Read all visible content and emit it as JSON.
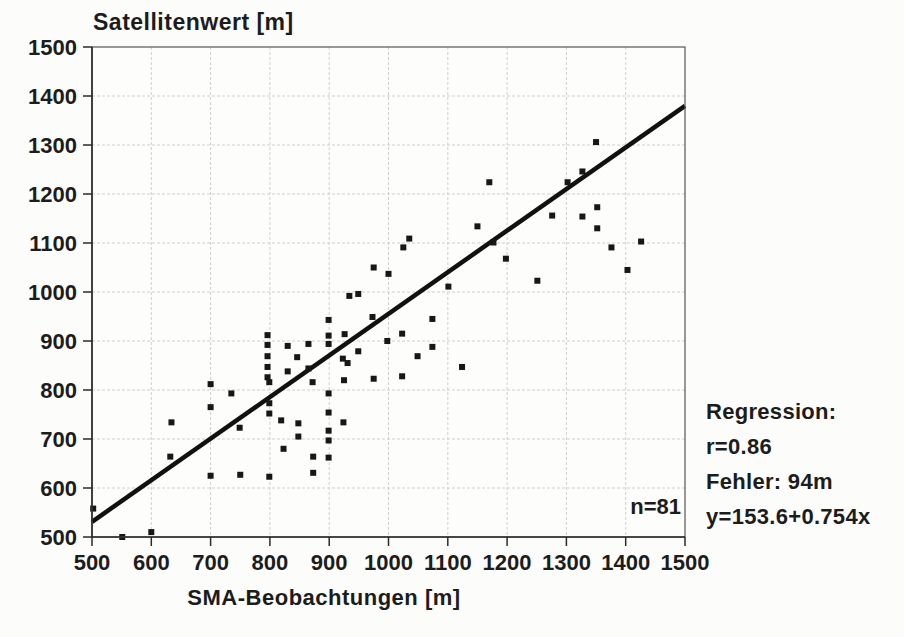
{
  "figure": {
    "title": "Satellitenwert [m]",
    "x_axis_title": "SMA-Beobachtungen [m]",
    "n_label": "n=81",
    "annotation": {
      "heading": "Regression:",
      "r_line": "r=0.86",
      "error_line": "Fehler: 94m",
      "equation_line": "y=153.6+0.754x"
    }
  },
  "colors": {
    "background": "#fcfcfa",
    "ink": "#1c1c1c",
    "grid": "#cdd1cc",
    "axis": "#2b2b2b",
    "box": "#555555",
    "point": "#171717",
    "regression_line": "#111111"
  },
  "chart_data": {
    "type": "scatter",
    "title": "Satellitenwert [m]",
    "xlabel": "SMA-Beobachtungen [m]",
    "ylabel": "Satellitenwert [m]",
    "xlim": [
      500,
      1500
    ],
    "ylim": [
      500,
      1500
    ],
    "x_ticks": [
      500,
      600,
      700,
      800,
      900,
      1000,
      1100,
      1200,
      1300,
      1400,
      1500
    ],
    "y_ticks": [
      500,
      600,
      700,
      800,
      900,
      1000,
      1100,
      1200,
      1300,
      1400,
      1500
    ],
    "grid": true,
    "n": 81,
    "annotations": [
      "n=81",
      "Regression:",
      "r=0.86",
      "Fehler: 94m",
      "y=153.6+0.754x"
    ],
    "regression": {
      "r": 0.86,
      "fehler_m": 94,
      "equation": "y=153.6+0.754x",
      "intercept": 153.6,
      "slope": 0.754
    },
    "regression_line_drawn": {
      "x": [
        500,
        1500
      ],
      "y": [
        531,
        1380
      ]
    },
    "points": [
      [
        502,
        558
      ],
      [
        551,
        500
      ],
      [
        600,
        510
      ],
      [
        632,
        664
      ],
      [
        634,
        734
      ],
      [
        700,
        625
      ],
      [
        700,
        765
      ],
      [
        700,
        812
      ],
      [
        735,
        793
      ],
      [
        749,
        723
      ],
      [
        750,
        627
      ],
      [
        796,
        912
      ],
      [
        796,
        892
      ],
      [
        796,
        869
      ],
      [
        796,
        847
      ],
      [
        796,
        826
      ],
      [
        799,
        816
      ],
      [
        799,
        773
      ],
      [
        799,
        752
      ],
      [
        799,
        623
      ],
      [
        819,
        738
      ],
      [
        823,
        680
      ],
      [
        830,
        890
      ],
      [
        830,
        838
      ],
      [
        846,
        867
      ],
      [
        848,
        732
      ],
      [
        848,
        705
      ],
      [
        865,
        894
      ],
      [
        865,
        844
      ],
      [
        872,
        816
      ],
      [
        873,
        664
      ],
      [
        873,
        631
      ],
      [
        899,
        943
      ],
      [
        899,
        911
      ],
      [
        899,
        894
      ],
      [
        899,
        793
      ],
      [
        899,
        754
      ],
      [
        899,
        717
      ],
      [
        899,
        697
      ],
      [
        899,
        662
      ],
      [
        923,
        864
      ],
      [
        924,
        734
      ],
      [
        925,
        820
      ],
      [
        926,
        914
      ],
      [
        931,
        855
      ],
      [
        934,
        992
      ],
      [
        949,
        996
      ],
      [
        949,
        879
      ],
      [
        973,
        949
      ],
      [
        975,
        1050
      ],
      [
        975,
        823
      ],
      [
        998,
        900
      ],
      [
        1000,
        1037
      ],
      [
        1023,
        915
      ],
      [
        1023,
        828
      ],
      [
        1025,
        1091
      ],
      [
        1035,
        1109
      ],
      [
        1049,
        869
      ],
      [
        1074,
        945
      ],
      [
        1074,
        888
      ],
      [
        1101,
        1011
      ],
      [
        1124,
        847
      ],
      [
        1150,
        1134
      ],
      [
        1170,
        1224
      ],
      [
        1177,
        1101
      ],
      [
        1198,
        1068
      ],
      [
        1251,
        1023
      ],
      [
        1276,
        1156
      ],
      [
        1302,
        1224
      ],
      [
        1327,
        1246
      ],
      [
        1327,
        1154
      ],
      [
        1350,
        1306
      ],
      [
        1352,
        1173
      ],
      [
        1352,
        1130
      ],
      [
        1376,
        1091
      ],
      [
        1403,
        1045
      ],
      [
        1426,
        1103
      ]
    ]
  }
}
